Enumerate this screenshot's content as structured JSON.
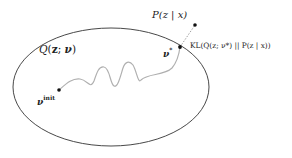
{
  "diagram": {
    "colors": {
      "ellipse_stroke": "#333333",
      "path_stroke": "#b0b0b0",
      "point_fill": "#111111",
      "dashed_line": "#888888",
      "text": "#222222"
    },
    "region": {
      "label_Q": "Q",
      "label_args": "(",
      "label_z": "z",
      "label_sep": "; ",
      "label_nu": "ν",
      "label_close": ")"
    },
    "points": {
      "init": {
        "symbol": "ν",
        "superscript": "init"
      },
      "optimum": {
        "symbol": "ν",
        "superscript": "*"
      },
      "posterior": {
        "label": "P(z | x)"
      }
    },
    "kl_label": "KL(Q(z; ν*) || P(z | x))"
  }
}
